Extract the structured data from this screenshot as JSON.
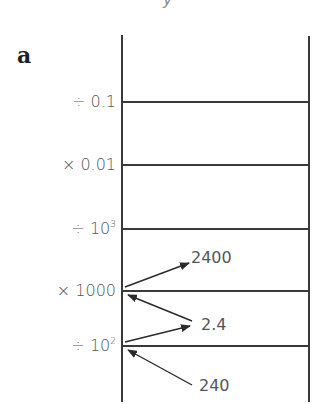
{
  "figure": {
    "panel_label": "a",
    "clipped_glyph": "y",
    "ladder": {
      "rungs": [
        {
          "label_prefix": "÷ ",
          "label_base": "0.1",
          "label_sup": "",
          "y": 102
        },
        {
          "label_prefix": "× ",
          "label_base": "0.01",
          "label_sup": "",
          "y": 165
        },
        {
          "label_prefix": "÷ ",
          "label_base": "10",
          "label_sup": "3",
          "y": 229
        },
        {
          "label_prefix": "× ",
          "label_base": "1000",
          "label_sup": "",
          "y": 291
        },
        {
          "label_prefix": "÷ ",
          "label_base": "10",
          "label_sup": "2",
          "y": 346
        }
      ]
    },
    "values": [
      {
        "text": "2400",
        "arrow_from_rung": "× 1000",
        "direction": "outgoing"
      },
      {
        "text": "2.4",
        "arrow_to_rung": "× 1000",
        "arrow_from_rung": "÷ 10²",
        "direction": "both"
      },
      {
        "text": "240",
        "arrow_to_rung": "÷ 10²",
        "direction": "incoming"
      }
    ],
    "colors": {
      "line": "#3a3a3a",
      "text": "#555555"
    }
  }
}
